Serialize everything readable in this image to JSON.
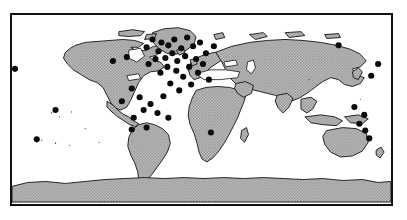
{
  "figure": {
    "kind": "world-map",
    "title": "",
    "caption": "",
    "projection": "equirectangular",
    "frame": {
      "visible": true,
      "color": "#111111",
      "thickness_px": 2
    },
    "colors": {
      "land_fill": "#a8a8a8",
      "land_outline": "#101010",
      "ocean_fill": "#ffffff",
      "point_marker": "#0a0a0a",
      "background": "#ffffff"
    },
    "legend": {
      "visible": false,
      "entries": []
    },
    "graticule": {
      "visible": false
    },
    "axis_labels": {
      "visible": false
    }
  },
  "chart_data": {
    "type": "scatter",
    "title": "",
    "xlabel": "",
    "ylabel": "",
    "xlim": [
      -180,
      180
    ],
    "ylim": [
      -90,
      90
    ],
    "grid": false,
    "legend_position": "none",
    "marker_color": "#0a0a0a",
    "marker_count": 55,
    "point_radius_px": 3.1,
    "series": [
      {
        "name": "sites",
        "points": [
          [
            13,
            68
          ],
          [
            35,
            140
          ],
          [
            54,
            110
          ],
          [
            112,
            60
          ],
          [
            121,
            101
          ],
          [
            126,
            56
          ],
          [
            131,
            88
          ],
          [
            133,
            118
          ],
          [
            139,
            97
          ],
          [
            143,
            110
          ],
          [
            146,
            46
          ],
          [
            148,
            63
          ],
          [
            150,
            104
          ],
          [
            152,
            38
          ],
          [
            155,
            58
          ],
          [
            158,
            50
          ],
          [
            160,
            72
          ],
          [
            161,
            41
          ],
          [
            163,
            96
          ],
          [
            165,
            57
          ],
          [
            167,
            66
          ],
          [
            168,
            44
          ],
          [
            170,
            83
          ],
          [
            172,
            52
          ],
          [
            174,
            38
          ],
          [
            176,
            70
          ],
          [
            177,
            60
          ],
          [
            179,
            90
          ],
          [
            181,
            47
          ],
          [
            183,
            76
          ],
          [
            185,
            55
          ],
          [
            187,
            36
          ],
          [
            189,
            66
          ],
          [
            191,
            84
          ],
          [
            193,
            45
          ],
          [
            196,
            58
          ],
          [
            198,
            72
          ],
          [
            200,
            41
          ],
          [
            203,
            63
          ],
          [
            206,
            52
          ],
          [
            209,
            79
          ],
          [
            211,
            133
          ],
          [
            214,
            45
          ],
          [
            157,
            113
          ],
          [
            168,
            118
          ],
          [
            146,
            128
          ],
          [
            131,
            130
          ],
          [
            373,
            75
          ],
          [
            340,
            44
          ],
          [
            356,
            107
          ],
          [
            361,
            124
          ],
          [
            367,
            131
          ],
          [
            371,
            139
          ],
          [
            366,
            115
          ],
          [
            380,
            63
          ]
        ]
      }
    ]
  },
  "elements": {
    "map_region_name": "world-map",
    "frame_name": "map-border"
  }
}
